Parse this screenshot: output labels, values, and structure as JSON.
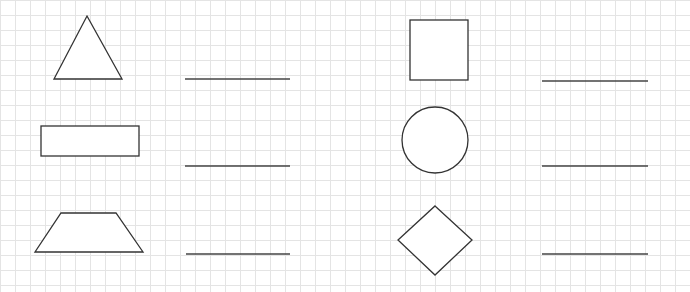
{
  "worksheet": {
    "grid": {
      "spacing_px": 15,
      "line_color": "#e4e4e4",
      "background": "#ffffff"
    },
    "stroke_color": "#333333",
    "items": [
      {
        "shape": "triangle",
        "column": "left",
        "row": 1,
        "answer": ""
      },
      {
        "shape": "rectangle",
        "column": "left",
        "row": 2,
        "answer": ""
      },
      {
        "shape": "trapezoid",
        "column": "left",
        "row": 3,
        "answer": ""
      },
      {
        "shape": "square",
        "column": "right",
        "row": 1,
        "answer": ""
      },
      {
        "shape": "circle",
        "column": "right",
        "row": 2,
        "answer": ""
      },
      {
        "shape": "diamond",
        "column": "right",
        "row": 3,
        "answer": ""
      }
    ]
  }
}
